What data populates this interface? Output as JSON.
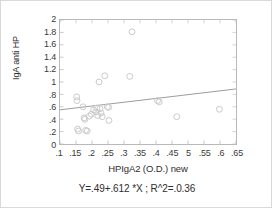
{
  "chart_data": {
    "type": "scatter",
    "title": "",
    "xlabel": "HPIgA2 (O.D.) new",
    "ylabel": "IgA anti HP",
    "xlim": [
      0.1,
      0.65
    ],
    "ylim": [
      0,
      2
    ],
    "grid": false,
    "legend": null,
    "marker": "open-circle",
    "marker_color": "#c9c9c9",
    "line_color": "#9a9a9a",
    "xticks": [
      0.1,
      0.15,
      0.2,
      0.25,
      0.3,
      0.35,
      0.4,
      0.45,
      0.5,
      0.55,
      0.6,
      0.65
    ],
    "xticklabels": [
      ".1",
      ".15",
      ".2",
      ".25",
      ".3",
      ".35",
      ".4",
      ".45",
      "5",
      ".55",
      ".6",
      ".65"
    ],
    "yticks": [
      0,
      0.2,
      0.4,
      0.6,
      0.8,
      1.0,
      1.2,
      1.4,
      1.6,
      1.8,
      2.0
    ],
    "yticklabels": [
      "0",
      ".2",
      ".4",
      ".6",
      ".8",
      "1",
      "1.2",
      "1.4",
      "1.6",
      "1.8",
      "2"
    ],
    "points": [
      {
        "x": 0.152,
        "y": 0.76
      },
      {
        "x": 0.153,
        "y": 0.7
      },
      {
        "x": 0.155,
        "y": 0.24
      },
      {
        "x": 0.158,
        "y": 0.21
      },
      {
        "x": 0.172,
        "y": 0.6
      },
      {
        "x": 0.175,
        "y": 0.42
      },
      {
        "x": 0.178,
        "y": 0.4
      },
      {
        "x": 0.18,
        "y": 0.22
      },
      {
        "x": 0.185,
        "y": 0.21
      },
      {
        "x": 0.192,
        "y": 0.45
      },
      {
        "x": 0.198,
        "y": 0.48
      },
      {
        "x": 0.205,
        "y": 0.55
      },
      {
        "x": 0.212,
        "y": 0.52
      },
      {
        "x": 0.215,
        "y": 0.58
      },
      {
        "x": 0.218,
        "y": 0.46
      },
      {
        "x": 0.222,
        "y": 1.0
      },
      {
        "x": 0.225,
        "y": 0.57
      },
      {
        "x": 0.228,
        "y": 0.5
      },
      {
        "x": 0.232,
        "y": 0.44
      },
      {
        "x": 0.24,
        "y": 1.1
      },
      {
        "x": 0.248,
        "y": 0.6
      },
      {
        "x": 0.252,
        "y": 0.59
      },
      {
        "x": 0.253,
        "y": 0.38
      },
      {
        "x": 0.325,
        "y": 1.81
      },
      {
        "x": 0.318,
        "y": 1.09
      },
      {
        "x": 0.405,
        "y": 0.7
      },
      {
        "x": 0.41,
        "y": 0.68
      },
      {
        "x": 0.465,
        "y": 0.44
      },
      {
        "x": 0.598,
        "y": 0.56
      }
    ],
    "fit_line": {
      "intercept": 0.49,
      "slope": 0.612,
      "x_start": 0.1,
      "x_end": 0.65,
      "y_start": 0.5512,
      "y_end": 0.8878
    },
    "equation_text": "Y=.49+.612 *X ; R^2=.0.36"
  }
}
